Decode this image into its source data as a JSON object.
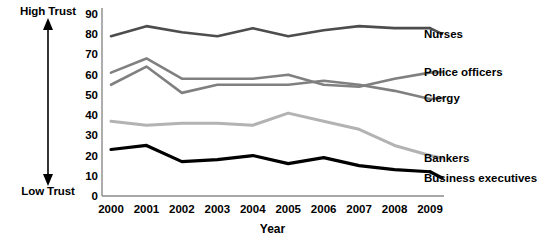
{
  "axis_annotations": {
    "high_trust": "High Trust",
    "low_trust": "Low Trust",
    "arrow_icon": "double-arrow-vertical-icon"
  },
  "chart_data": {
    "type": "line",
    "title": "",
    "subtitle": "",
    "xlabel": "Year",
    "ylabel": "",
    "categories": [
      "2000",
      "2001",
      "2002",
      "2003",
      "2004",
      "2005",
      "2006",
      "2007",
      "2008",
      "2009"
    ],
    "x": [
      2000,
      2001,
      2002,
      2003,
      2004,
      2005,
      2006,
      2007,
      2008,
      2009
    ],
    "ylim": [
      0,
      90
    ],
    "yticks": [
      0,
      10,
      20,
      30,
      40,
      50,
      60,
      70,
      80,
      90
    ],
    "ytick_labels": [
      "0",
      "10",
      "20",
      "30",
      "40",
      "50",
      "60",
      "70",
      "80",
      "90"
    ],
    "grid": false,
    "legend_position": "right-inline",
    "series": [
      {
        "name": "Nurses",
        "color": "#4d4d4d",
        "width": 2.6,
        "values": [
          79,
          84,
          81,
          79,
          83,
          79,
          82,
          84,
          83,
          83
        ]
      },
      {
        "name": "Police officers",
        "color": "#808080",
        "width": 2.6,
        "values": [
          61,
          68,
          58,
          58,
          58,
          60,
          55,
          54,
          58,
          61
        ]
      },
      {
        "name": "Clergy",
        "color": "#808080",
        "width": 2.6,
        "values": [
          55,
          64,
          51,
          55,
          55,
          55,
          57,
          55,
          52,
          48
        ]
      },
      {
        "name": "Bankers",
        "color": "#b3b3b3",
        "width": 3.0,
        "values": [
          37,
          35,
          36,
          36,
          35,
          41,
          37,
          33,
          25,
          20
        ]
      },
      {
        "name": "Business executives",
        "color": "#000000",
        "width": 3.2,
        "values": [
          23,
          25,
          17,
          18,
          20,
          16,
          19,
          15,
          13,
          12
        ]
      }
    ],
    "annotations": [
      {
        "text": "High Trust",
        "position": "y-axis-top"
      },
      {
        "text": "Low Trust",
        "position": "y-axis-bottom"
      }
    ]
  }
}
